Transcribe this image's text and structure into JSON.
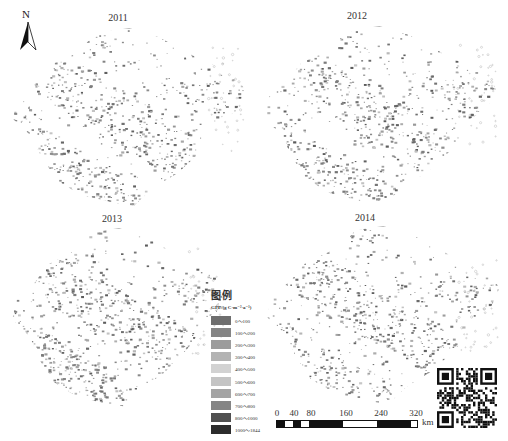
{
  "figure": {
    "north_arrow": {
      "label": "N",
      "icon": "north-arrow-icon"
    },
    "panels": [
      {
        "year": "2011"
      },
      {
        "year": "2012"
      },
      {
        "year": "2013"
      },
      {
        "year": "2014"
      }
    ],
    "legend": {
      "heading": "图例",
      "unit": "GPP/(g C·m⁻²·a⁻¹)",
      "classes": [
        {
          "label": "0～100",
          "color": "#6e6e6e"
        },
        {
          "label": "100～200",
          "color": "#858585"
        },
        {
          "label": "200～300",
          "color": "#9c9c9c"
        },
        {
          "label": "300～400",
          "color": "#b3b3b3"
        },
        {
          "label": "400～500",
          "color": "#d2d2d2"
        },
        {
          "label": "500～600",
          "color": "#c4c4c4"
        },
        {
          "label": "600～700",
          "color": "#a4a4a4"
        },
        {
          "label": "700～800",
          "color": "#858585"
        },
        {
          "label": "800～1000",
          "color": "#505050"
        },
        {
          "label": "1000～1844",
          "color": "#2c2c2c"
        }
      ]
    },
    "scale_bar": {
      "ticks": [
        "0",
        "40",
        "80",
        "160",
        "240",
        "320"
      ],
      "unit": "km"
    },
    "qr_code": {
      "icon": "qr-code-icon"
    }
  }
}
